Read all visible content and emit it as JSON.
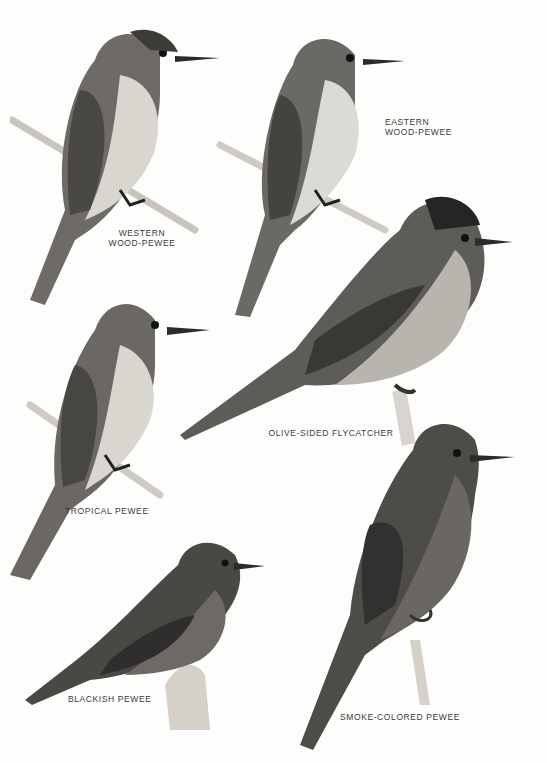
{
  "plate": {
    "birds": [
      {
        "id": "western-wood-pewee",
        "label": "WESTERN\nWOOD-PEWEE"
      },
      {
        "id": "eastern-wood-pewee",
        "label": "EASTERN\nWOOD-PEWEE"
      },
      {
        "id": "olive-sided-flycatcher",
        "label": "OLIVE-SIDED FLYCATCHER"
      },
      {
        "id": "tropical-pewee",
        "label": "TROPICAL PEWEE"
      },
      {
        "id": "blackish-pewee",
        "label": "BLACKISH PEWEE"
      },
      {
        "id": "smoke-colored-pewee",
        "label": "SMOKE-COLORED PEWEE"
      }
    ]
  }
}
